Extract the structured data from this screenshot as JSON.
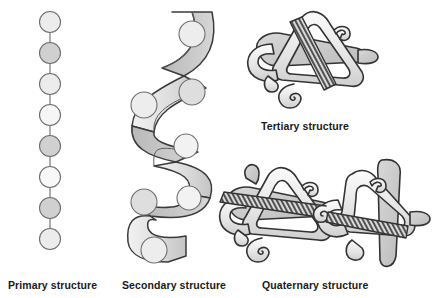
{
  "figure": {
    "background_color": "#ffffff",
    "width": 443,
    "height": 298
  },
  "palette": {
    "outline": "#3a3a3a",
    "bead_light": "#ececec",
    "bead_mid": "#d0d0d0",
    "ribbon_light": "#e2e2e2",
    "ribbon_mid": "#c9c9c9",
    "ribbon_dark": "#b0b0b0",
    "coil_dark": "#555555",
    "label_color": "#1a1a1a"
  },
  "panels": [
    {
      "id": "primary",
      "label": "Primary structure",
      "icon": "amino-acid-bead-chain",
      "bead_count": 8,
      "bead_fills": [
        "light",
        "mid",
        "light",
        "light",
        "mid",
        "light",
        "mid",
        "light"
      ],
      "bead_radius": 10.5,
      "bead_spacing": 31,
      "first_bead_cy": 22,
      "chain_cx": 50
    },
    {
      "id": "secondary",
      "label": "Secondary structure",
      "icon": "alpha-helix-ribbon",
      "turn_count": 3,
      "bead_count": 6,
      "ribbon_width": 26
    },
    {
      "id": "tertiary",
      "label": "Tertiary structure",
      "icon": "folded-polypeptide-globule",
      "has_coil_segment": true
    },
    {
      "id": "quaternary",
      "label": "Quaternary structure",
      "icon": "multi-subunit-assembly",
      "subunit_count": 2,
      "has_coil_segment": true
    }
  ]
}
